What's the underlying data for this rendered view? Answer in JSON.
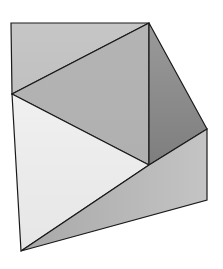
{
  "diagram": {
    "type": "polygon-net",
    "vertices": {
      "A": [
        11,
        23
      ],
      "B": [
        149,
        23
      ],
      "C": [
        12,
        94
      ],
      "D": [
        149,
        165
      ],
      "E": [
        207,
        129
      ],
      "F": [
        207,
        200
      ],
      "G": [
        21,
        251
      ]
    },
    "faces": [
      {
        "id": "top-left-triangle",
        "points": [
          "A",
          "B",
          "C"
        ],
        "fill": "#c6c6c6",
        "fill_end": "#c0c0c0"
      },
      {
        "id": "center-triangle",
        "points": [
          "B",
          "D",
          "C"
        ],
        "fill": "#b4b4b4",
        "fill_end": "#b0b0b0"
      },
      {
        "id": "right-triangle",
        "points": [
          "B",
          "E",
          "D"
        ],
        "fill": "#9a9a9a",
        "fill_end": "#7e7e7e"
      },
      {
        "id": "left-triangle",
        "points": [
          "C",
          "D",
          "G"
        ],
        "fill": "#f0f0f0",
        "fill_end": "#e6e6e6"
      },
      {
        "id": "bottom-quad",
        "points": [
          "D",
          "E",
          "F",
          "G"
        ],
        "fill": "#a8a8a8",
        "fill_end": "#c4c4c4"
      }
    ],
    "stroke_color": "#1a1a1a"
  }
}
